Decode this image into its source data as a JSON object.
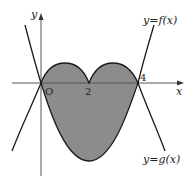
{
  "diagram": {
    "axes": {
      "x_label": "x",
      "y_label": "y",
      "origin_label": "O"
    },
    "ticks": [
      {
        "label": "2",
        "value": 2
      },
      {
        "label": "4",
        "value": 4
      }
    ],
    "curves": {
      "f_label": "y=f(x)",
      "g_label": "y=g(x)"
    },
    "region": {
      "description": "Shaded region enclosed between y=f(x) and y=g(x) from x=0 to x=4",
      "fill_color": "#8c8c8c"
    },
    "colors": {
      "curve": "#1a1a1a",
      "axis": "#555555",
      "background": "#ffffff"
    }
  }
}
